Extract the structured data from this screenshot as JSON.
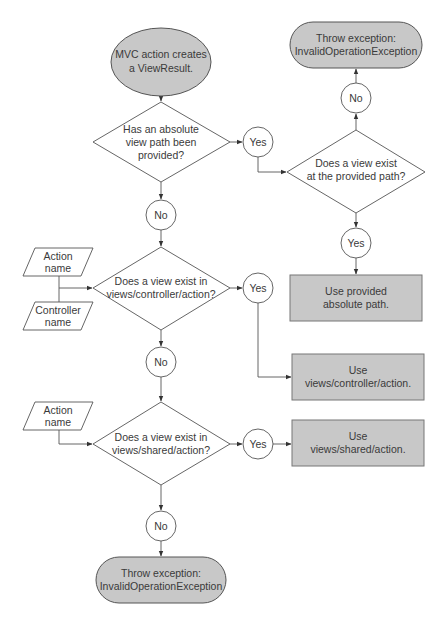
{
  "diagram": {
    "nodes": {
      "start": {
        "type": "terminal-ellipse",
        "lines": [
          "MVC action creates",
          "a ViewResult."
        ]
      },
      "d_absolute": {
        "type": "decision",
        "lines": [
          "Has an absolute",
          "view path been",
          "provided?"
        ]
      },
      "d_exists_path": {
        "type": "decision",
        "lines": [
          "Does a view exist",
          "at the provided path?"
        ]
      },
      "d_controller": {
        "type": "decision",
        "lines": [
          "Does a view exist in",
          "views/controller/action?"
        ]
      },
      "d_shared": {
        "type": "decision",
        "lines": [
          "Does a view exist in",
          "views/shared/action?"
        ]
      },
      "throw_top": {
        "type": "terminal",
        "lines": [
          "Throw exception:",
          "InvalidOperationException"
        ]
      },
      "throw_bottom": {
        "type": "terminal",
        "lines": [
          "Throw exception:",
          "InvalidOperationException"
        ]
      },
      "use_absolute": {
        "type": "process",
        "lines": [
          "Use provided",
          "absolute path."
        ]
      },
      "use_controller": {
        "type": "process",
        "lines": [
          "Use",
          "views/controller/action."
        ]
      },
      "use_shared": {
        "type": "process",
        "lines": [
          "Use",
          "views/shared/action."
        ]
      },
      "input_action_1": {
        "type": "data",
        "lines": [
          "Action",
          "name"
        ]
      },
      "input_controller": {
        "type": "data",
        "lines": [
          "Controller",
          "name"
        ]
      },
      "input_action_2": {
        "type": "data",
        "lines": [
          "Action",
          "name"
        ]
      }
    },
    "connectors": {
      "yes_absolute": "Yes",
      "no_absolute": "No",
      "yes_exists_path": "Yes",
      "no_exists_path": "No",
      "yes_controller": "Yes",
      "no_controller": "No",
      "yes_shared": "Yes",
      "no_shared": "No"
    },
    "edges": [
      [
        "start",
        "d_absolute"
      ],
      [
        "d_absolute",
        "yes_absolute"
      ],
      [
        "yes_absolute",
        "d_exists_path"
      ],
      [
        "d_exists_path",
        "no_exists_path"
      ],
      [
        "no_exists_path",
        "throw_top"
      ],
      [
        "d_exists_path",
        "yes_exists_path"
      ],
      [
        "yes_exists_path",
        "use_absolute"
      ],
      [
        "d_absolute",
        "no_absolute"
      ],
      [
        "no_absolute",
        "d_controller"
      ],
      [
        "input_action_1",
        "d_controller"
      ],
      [
        "input_controller",
        "d_controller"
      ],
      [
        "d_controller",
        "yes_controller"
      ],
      [
        "yes_controller",
        "use_controller"
      ],
      [
        "d_controller",
        "no_controller"
      ],
      [
        "no_controller",
        "d_shared"
      ],
      [
        "input_action_2",
        "d_shared"
      ],
      [
        "d_shared",
        "yes_shared"
      ],
      [
        "yes_shared",
        "use_shared"
      ],
      [
        "d_shared",
        "no_shared"
      ],
      [
        "no_shared",
        "throw_bottom"
      ]
    ]
  }
}
